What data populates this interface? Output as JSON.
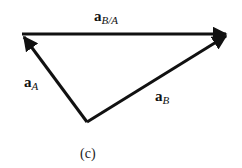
{
  "diagram": {
    "type": "vector-triangle",
    "caption": "(c)",
    "vectors": [
      {
        "id": "aB/A",
        "base": "a",
        "sub": "B/A",
        "from": [
          22,
          34
        ],
        "to": [
          228,
          34
        ]
      },
      {
        "id": "aA",
        "base": "a",
        "sub": "A",
        "from": [
          87,
          122
        ],
        "to": [
          22,
          34
        ]
      },
      {
        "id": "aB",
        "base": "a",
        "sub": "B",
        "from": [
          87,
          122
        ],
        "to": [
          228,
          34
        ]
      }
    ],
    "stroke_color": "#111111"
  }
}
